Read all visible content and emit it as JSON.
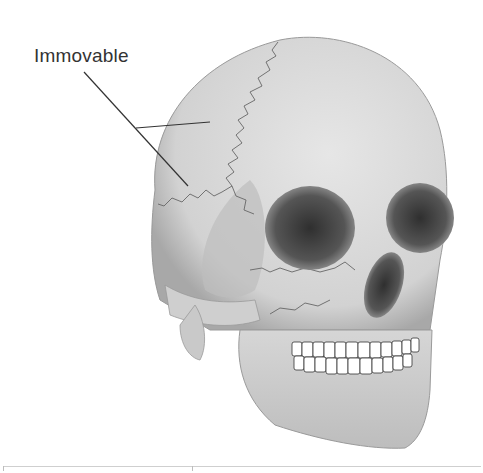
{
  "figure": {
    "labels": [
      {
        "text": "Immovable",
        "points_to": "cranial sutures"
      }
    ]
  },
  "colors": {
    "bone": "#d9d9d9",
    "bone_shadow": "#a8a8a8",
    "cavity": "#4a4a4a",
    "teeth": "#ffffff",
    "leader_line": "#333333"
  }
}
